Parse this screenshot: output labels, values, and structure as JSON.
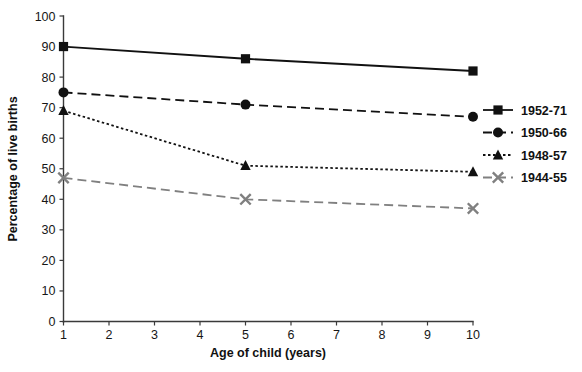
{
  "chart_data": {
    "type": "line",
    "title": "",
    "xlabel": "Age of child (years)",
    "ylabel": "Percentage of live births",
    "xlim": [
      1,
      10
    ],
    "ylim": [
      0,
      100
    ],
    "grid": false,
    "legend_position": "right",
    "x": [
      1,
      5,
      10
    ],
    "xticks": [
      "1",
      "2",
      "3",
      "4",
      "5",
      "6",
      "7",
      "8",
      "9",
      "10"
    ],
    "yticks": [
      "0",
      "10",
      "20",
      "30",
      "40",
      "50",
      "60",
      "70",
      "80",
      "90",
      "100"
    ],
    "series": [
      {
        "name": "1952-71",
        "values": [
          90,
          86,
          82
        ],
        "marker": "square",
        "linestyle": "solid",
        "color": "#111111"
      },
      {
        "name": "1950-66",
        "values": [
          75,
          71,
          67
        ],
        "marker": "circle",
        "linestyle": "dashed",
        "color": "#111111"
      },
      {
        "name": "1948-57",
        "values": [
          69,
          51,
          49
        ],
        "marker": "triangle",
        "linestyle": "dotted",
        "color": "#111111"
      },
      {
        "name": "1944-55",
        "values": [
          47,
          40,
          37
        ],
        "marker": "x",
        "linestyle": "dashed",
        "color": "#808080"
      }
    ]
  },
  "legend": {
    "items": [
      {
        "label": "1952-71"
      },
      {
        "label": "1950-66"
      },
      {
        "label": "1948-57"
      },
      {
        "label": "1944-55"
      }
    ]
  },
  "axes": {
    "x_title": "Age of child (years)",
    "y_title": "Percentage of live births"
  }
}
